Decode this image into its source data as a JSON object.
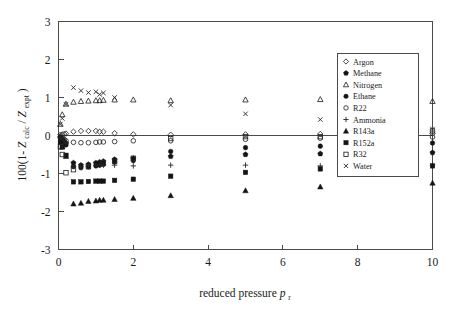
{
  "figure": {
    "title": "",
    "background_color": "#ffffff",
    "axis_color": "#4a4a4a",
    "marker_color": "#141414"
  },
  "axes": {
    "x_label_main": "reduced pressure",
    "x_label_symbol": "p",
    "x_label_subscript": "r",
    "y_label_prefix": "100(1-",
    "y_label_z1": "Z",
    "y_label_sub1": "calc",
    "y_label_slash": "/",
    "y_label_z2": "Z",
    "y_label_sub2": "expt",
    "y_label_suffix": ")",
    "x_ticks": [
      "0",
      "2",
      "4",
      "6",
      "8",
      "10"
    ],
    "y_ticks": [
      "3",
      "2",
      "1",
      "0",
      "-1",
      "-2",
      "-3"
    ],
    "x_min": 0,
    "x_max": 10,
    "y_min": -3,
    "y_max": 3
  },
  "legend": {
    "position": "upper-right-inside",
    "entries": [
      {
        "label": "Argon",
        "marker": "open-diamond"
      },
      {
        "label": "Methane",
        "marker": "filled-pentagon"
      },
      {
        "label": "Nitrogen",
        "marker": "open-triangle"
      },
      {
        "label": "Ethane",
        "marker": "filled-circle"
      },
      {
        "label": "R22",
        "marker": "open-circle"
      },
      {
        "label": "Ammonia",
        "marker": "plus"
      },
      {
        "label": "R143a",
        "marker": "filled-triangle"
      },
      {
        "label": "R152a",
        "marker": "filled-square"
      },
      {
        "label": "R32",
        "marker": "open-square"
      },
      {
        "label": "Water",
        "marker": "cross"
      }
    ]
  },
  "chart_data": {
    "type": "scatter",
    "title": "",
    "xlabel": "reduced pressure p_r",
    "ylabel": "100(1-Z_calc/Z_expt)",
    "xlim": [
      0,
      10
    ],
    "ylim": [
      -3,
      3
    ],
    "xticks": [
      0,
      2,
      4,
      6,
      8,
      10
    ],
    "yticks": [
      -3,
      -2,
      -1,
      0,
      1,
      2,
      3
    ],
    "grid": false,
    "zero_reference_line": true,
    "legend_position": "upper right",
    "series": [
      {
        "name": "Argon",
        "marker": "open-diamond",
        "x": [
          0.05,
          0.1,
          0.15,
          0.2,
          0.4,
          0.6,
          0.8,
          1.0,
          1.1,
          1.2,
          1.5,
          2.0,
          3.0,
          5.0,
          7.0,
          10.0
        ],
        "y": [
          0.02,
          0.03,
          0.04,
          0.05,
          0.1,
          0.12,
          0.12,
          0.12,
          0.1,
          0.1,
          0.06,
          0.03,
          0.02,
          0.03,
          0.04,
          0.05
        ]
      },
      {
        "name": "Methane",
        "marker": "filled-pentagon",
        "x": [
          0.05,
          0.1,
          0.15,
          0.2,
          0.4,
          0.6,
          0.8,
          1.0,
          1.1,
          1.2,
          1.5,
          2.0,
          3.0,
          5.0,
          7.0,
          10.0
        ],
        "y": [
          -0.05,
          -0.1,
          -0.15,
          -0.2,
          -0.72,
          -0.78,
          -0.76,
          -0.72,
          -0.7,
          -0.68,
          -0.63,
          -0.6,
          -0.55,
          -0.5,
          -0.48,
          -0.45
        ]
      },
      {
        "name": "Nitrogen",
        "marker": "open-triangle",
        "x": [
          0.05,
          0.1,
          0.2,
          0.4,
          0.6,
          0.8,
          1.0,
          1.1,
          1.2,
          1.5,
          2.0,
          3.0,
          5.0,
          7.0,
          10.0
        ],
        "y": [
          0.3,
          0.55,
          0.83,
          0.88,
          0.9,
          0.91,
          0.92,
          0.92,
          0.93,
          0.94,
          0.94,
          0.92,
          0.94,
          0.95,
          0.9
        ]
      },
      {
        "name": "Ethane",
        "marker": "filled-circle",
        "x": [
          0.05,
          0.1,
          0.15,
          0.2,
          0.4,
          0.6,
          0.8,
          1.0,
          1.1,
          1.2,
          1.5,
          2.0,
          3.0,
          5.0,
          7.0,
          10.0
        ],
        "y": [
          -0.06,
          -0.12,
          -0.18,
          -0.25,
          -0.82,
          -0.85,
          -0.83,
          -0.8,
          -0.78,
          -0.76,
          -0.7,
          -0.66,
          -0.42,
          -0.32,
          -0.28,
          -0.2
        ]
      },
      {
        "name": "R22",
        "marker": "open-circle",
        "x": [
          0.05,
          0.1,
          0.15,
          0.2,
          0.4,
          0.6,
          0.8,
          1.0,
          1.1,
          1.2,
          1.5,
          2.0,
          3.0,
          5.0,
          7.0,
          10.0
        ],
        "y": [
          -0.03,
          -0.06,
          -0.1,
          -0.14,
          -0.18,
          -0.19,
          -0.19,
          -0.18,
          -0.17,
          -0.17,
          -0.16,
          -0.14,
          -0.14,
          -0.1,
          -0.07,
          -0.04
        ]
      },
      {
        "name": "Ammonia",
        "marker": "plus",
        "x": [
          0.05,
          0.1,
          0.2,
          0.4,
          0.6,
          0.8,
          1.0,
          1.1,
          1.2,
          1.5,
          2.0,
          3.0,
          5.0,
          7.0,
          10.0
        ],
        "y": [
          -0.05,
          -0.1,
          -0.2,
          -0.8,
          -0.81,
          -0.8,
          -0.79,
          -0.78,
          -0.78,
          -0.78,
          -0.8,
          -0.78,
          -0.78,
          -0.8,
          -0.78
        ]
      },
      {
        "name": "R143a",
        "marker": "filled-triangle",
        "x": [
          0.1,
          0.2,
          0.4,
          0.6,
          0.8,
          1.0,
          1.1,
          1.2,
          1.5,
          2.0,
          3.0,
          5.0,
          7.0,
          10.0
        ],
        "y": [
          -0.3,
          -0.55,
          -1.8,
          -1.78,
          -1.73,
          -1.72,
          -1.7,
          -1.7,
          -1.68,
          -1.65,
          -1.58,
          -1.45,
          -1.35,
          -1.25
        ]
      },
      {
        "name": "R152a",
        "marker": "filled-square",
        "x": [
          0.05,
          0.1,
          0.2,
          0.4,
          0.6,
          0.8,
          1.0,
          1.1,
          1.2,
          1.5,
          2.0,
          3.0,
          5.0,
          7.0,
          10.0
        ],
        "y": [
          -0.18,
          -0.3,
          -0.52,
          -1.22,
          -1.22,
          -1.21,
          -1.2,
          -1.2,
          -1.2,
          -1.18,
          -1.15,
          -1.07,
          -0.97,
          -0.88,
          -0.8
        ]
      },
      {
        "name": "R32",
        "marker": "open-square",
        "x": [
          0.05,
          0.1,
          0.2,
          0.4,
          0.8,
          1.2,
          1.5,
          2.0,
          3.0,
          5.0,
          7.0,
          10.0
        ],
        "y": [
          -0.3,
          -0.5,
          -0.98,
          -0.9,
          -0.82,
          -0.72,
          -0.68,
          -0.6,
          -0.08,
          -0.03,
          -0.03,
          0.12
        ]
      },
      {
        "name": "Water",
        "marker": "cross",
        "x": [
          0.05,
          0.1,
          0.2,
          0.4,
          0.6,
          0.8,
          1.0,
          1.1,
          1.2,
          1.5,
          3.0,
          5.0,
          7.0,
          10.0
        ],
        "y": [
          0.3,
          0.45,
          0.82,
          1.26,
          1.18,
          1.13,
          1.15,
          1.08,
          1.12,
          1.0,
          0.8,
          0.57,
          0.42,
          0.17
        ]
      }
    ]
  }
}
